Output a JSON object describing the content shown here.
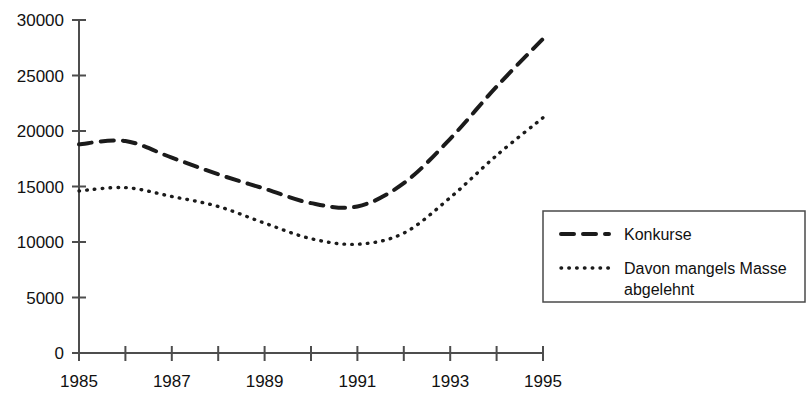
{
  "chart_data": {
    "type": "line",
    "title": "",
    "subtitle": "",
    "xlabel": "",
    "ylabel": "",
    "x": [
      1985,
      1986,
      1987,
      1988,
      1989,
      1990,
      1991,
      1992,
      1993,
      1994,
      1995
    ],
    "xlim": [
      1985,
      1995
    ],
    "ylim": [
      0,
      30000
    ],
    "grid": false,
    "legend_position": "right-middle",
    "x_tick_labels": [
      "1985",
      "1987",
      "1989",
      "1991",
      "1993",
      "1995"
    ],
    "x_tick_label_values": [
      1985,
      1987,
      1989,
      1991,
      1993,
      1995
    ],
    "x_minor_ticks": [
      1985,
      1986,
      1987,
      1988,
      1989,
      1990,
      1991,
      1992,
      1993,
      1994,
      1995
    ],
    "y_tick_labels": [
      "0",
      "5000",
      "10000",
      "15000",
      "20000",
      "25000",
      "30000"
    ],
    "y_tick_values": [
      0,
      5000,
      10000,
      15000,
      20000,
      25000,
      30000
    ],
    "series": [
      {
        "name": "Konkurse",
        "style": "dashed",
        "color": "#1b1b1b",
        "values": [
          18800,
          19100,
          17600,
          16100,
          14800,
          13500,
          13200,
          15300,
          19300,
          24000,
          28300
        ]
      },
      {
        "name": "Davon mangels Masse abgelehnt",
        "style": "dotted",
        "color": "#1b1b1b",
        "values": [
          14600,
          14900,
          14100,
          13200,
          11700,
          10300,
          9800,
          10800,
          14000,
          17800,
          21200
        ]
      }
    ]
  },
  "legend": {
    "entries": [
      {
        "label": "Konkurse",
        "label_line2": ""
      },
      {
        "label": "Davon mangels Masse",
        "label_line2": "abgelehnt"
      }
    ]
  }
}
